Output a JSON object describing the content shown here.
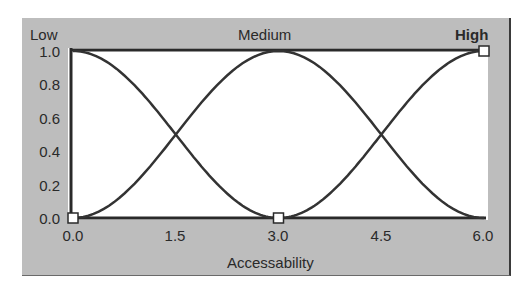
{
  "chart_data": {
    "type": "line",
    "title": "",
    "xlabel": "Accessability",
    "ylabel": "",
    "xlim": [
      0.0,
      6.0
    ],
    "ylim": [
      0.0,
      1.0
    ],
    "x_ticks": [
      "0.0",
      "1.5",
      "3.0",
      "4.5",
      "6.0"
    ],
    "y_ticks": [
      "0.0",
      "0.2",
      "0.4",
      "0.6",
      "0.8",
      "1.0"
    ],
    "legend": [
      "Low",
      "Medium",
      "High"
    ],
    "selected_term": "High",
    "grid": false,
    "series": [
      {
        "name": "Low",
        "x": [
          0.0,
          0.75,
          1.5,
          2.25,
          3.0
        ],
        "values": [
          1.0,
          0.85,
          0.5,
          0.15,
          0.0
        ]
      },
      {
        "name": "Medium",
        "x": [
          0.0,
          0.75,
          1.5,
          2.25,
          3.0,
          3.75,
          4.5,
          5.25,
          6.0
        ],
        "values": [
          0.0,
          0.15,
          0.5,
          0.85,
          1.0,
          0.85,
          0.5,
          0.15,
          0.0
        ]
      },
      {
        "name": "High",
        "x": [
          3.0,
          3.75,
          4.5,
          5.25,
          6.0
        ],
        "values": [
          0.0,
          0.15,
          0.5,
          0.85,
          1.0
        ]
      }
    ],
    "handles": [
      {
        "x": 0.0,
        "y": 0.0
      },
      {
        "x": 3.0,
        "y": 0.0
      },
      {
        "x": 6.0,
        "y": 1.0
      }
    ]
  },
  "labels": {
    "low": "Low",
    "medium": "Medium",
    "high": "High",
    "xaxis": "Accessability"
  },
  "ticks": {
    "y": [
      "1.0",
      "0.8",
      "0.6",
      "0.4",
      "0.2",
      "0.0"
    ],
    "x": [
      "0.0",
      "1.5",
      "3.0",
      "4.5",
      "6.0"
    ]
  }
}
